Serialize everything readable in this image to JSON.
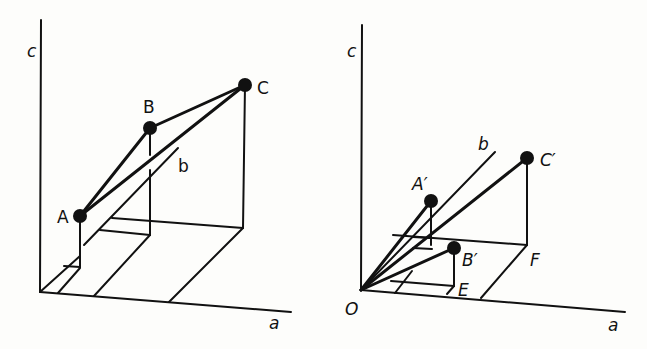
{
  "left_diagram": {
    "axes": {
      "vertical": "c",
      "horizontal": "a",
      "depth": "b"
    },
    "points": [
      {
        "label": "A"
      },
      {
        "label": "B"
      },
      {
        "label": "C"
      }
    ]
  },
  "right_diagram": {
    "axes": {
      "vertical": "c",
      "horizontal": "a",
      "depth": "b"
    },
    "origin": "O",
    "points": [
      {
        "label": "A′"
      },
      {
        "label": "B′"
      },
      {
        "label": "C′"
      }
    ],
    "floor_points": [
      {
        "label": "E"
      },
      {
        "label": "F"
      }
    ]
  },
  "colors": {
    "ink": "#111111",
    "paper": "#fdfdfb"
  }
}
